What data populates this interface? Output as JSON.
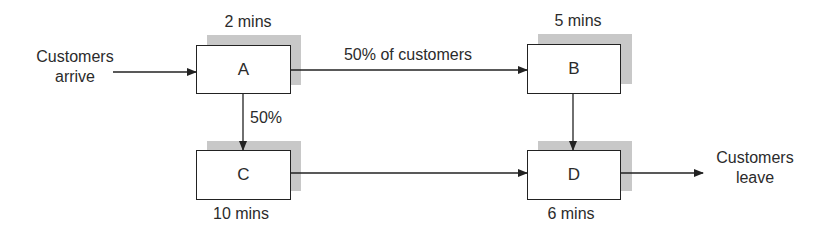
{
  "diagram": {
    "nodes": [
      {
        "id": "A",
        "label": "A",
        "time": "2 mins"
      },
      {
        "id": "B",
        "label": "B",
        "time": "5 mins"
      },
      {
        "id": "C",
        "label": "C",
        "time": "10 mins"
      },
      {
        "id": "D",
        "label": "D",
        "time": "6 mins"
      }
    ],
    "edges": [
      {
        "from": "start",
        "to": "A",
        "label": ""
      },
      {
        "from": "A",
        "to": "B",
        "label": "50% of customers"
      },
      {
        "from": "A",
        "to": "C",
        "label": "50%"
      },
      {
        "from": "B",
        "to": "D",
        "label": ""
      },
      {
        "from": "C",
        "to": "D",
        "label": ""
      },
      {
        "from": "D",
        "to": "end",
        "label": ""
      }
    ],
    "start_label": [
      "Customers",
      "arrive"
    ],
    "end_label": [
      "Customers",
      "leave"
    ]
  },
  "colors": {
    "line": "#222222",
    "shadow": "#c8c8c8",
    "text": "#2b2b2b"
  }
}
